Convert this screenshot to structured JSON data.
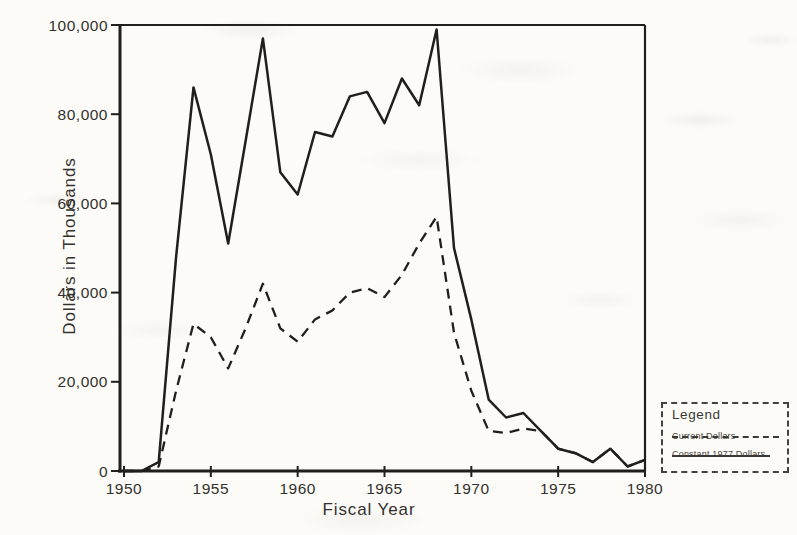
{
  "page": {
    "background": "#fcfbf8",
    "ink": "#201f1c",
    "text_color": "#33312d"
  },
  "chart_data": {
    "type": "line",
    "title": "",
    "xlabel": "Fiscal Year",
    "ylabel": "Dollars in Thousands",
    "xlim": [
      1950,
      1980
    ],
    "ylim": [
      0,
      100000
    ],
    "grid": false,
    "x_ticks": [
      1950,
      1955,
      1960,
      1965,
      1970,
      1975,
      1980
    ],
    "x_tick_labels": [
      "1950",
      "1955",
      "1960",
      "1965",
      "1970",
      "1975",
      "1980"
    ],
    "y_ticks": [
      0,
      20000,
      40000,
      60000,
      80000,
      100000
    ],
    "y_tick_labels": [
      "0",
      "20,000",
      "40,000",
      "60,000",
      "80,000",
      "100,000"
    ],
    "x": [
      1950,
      1951,
      1952,
      1953,
      1954,
      1955,
      1956,
      1957,
      1958,
      1959,
      1960,
      1961,
      1962,
      1963,
      1964,
      1965,
      1966,
      1967,
      1968,
      1969,
      1970,
      1971,
      1972,
      1973,
      1974,
      1975,
      1976,
      1977,
      1978,
      1979,
      1980
    ],
    "series": [
      {
        "name": "Current Dollars",
        "line_style": "dashed",
        "values": [
          0,
          0,
          1000,
          18000,
          33000,
          30000,
          23000,
          32000,
          42000,
          32000,
          29000,
          34000,
          36000,
          40000,
          41000,
          39000,
          44000,
          51000,
          57000,
          31000,
          18000,
          9000,
          8500,
          9500,
          9000,
          5000,
          4000,
          2000,
          5000,
          1000,
          2500
        ]
      },
      {
        "name": "Constant 1977 Dollars",
        "line_style": "solid",
        "values": [
          0,
          0,
          2000,
          48000,
          86000,
          71000,
          51000,
          74000,
          97000,
          67000,
          62000,
          76000,
          75000,
          84000,
          85000,
          78000,
          88000,
          82000,
          99000,
          50000,
          34000,
          16000,
          12000,
          13000,
          9000,
          5000,
          4000,
          2000,
          5000,
          1000,
          2500
        ]
      }
    ],
    "legend": {
      "title": "Legend",
      "position": "outside-bottom-right"
    }
  }
}
